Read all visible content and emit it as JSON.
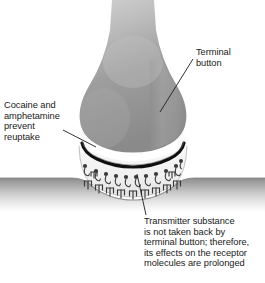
{
  "figure": {
    "width": 265,
    "height": 283,
    "background": "#ffffff"
  },
  "labels": {
    "terminal_button": "Terminal\nbutton",
    "cocaine": "Cocaine and\namphetamine\nprevent\nreuptake",
    "transmitter": "Transmitter substance\nis not taken back by\nterminal button; therefore,\nits effects on the receptor\nmolecules are prolonged"
  },
  "structures": {
    "axon": "axon",
    "terminal_button": "terminal-button",
    "presynaptic_membrane": "presynaptic-membrane",
    "synaptic_cleft": "synaptic-cleft",
    "postsynaptic_membrane": "postsynaptic-membrane",
    "transmitter_molecules": "transmitter-molecules",
    "receptor_molecules": "receptor-molecules"
  },
  "colors": {
    "axon_light": "#e3e3e3",
    "terminal_top": "#c9c9c9",
    "terminal_mid": "#9a9a9a",
    "terminal_bottom": "#868686",
    "membrane_dark": "#111111",
    "cleft_fill": "#f2f2f2",
    "postsynaptic_band": "#8f8f8f",
    "molecule": "#3a3a3a",
    "leader_line": "#222222",
    "text": "#1a1a1a"
  },
  "counts": {
    "transmitter_molecules": 11,
    "receptor_molecules": 11
  }
}
